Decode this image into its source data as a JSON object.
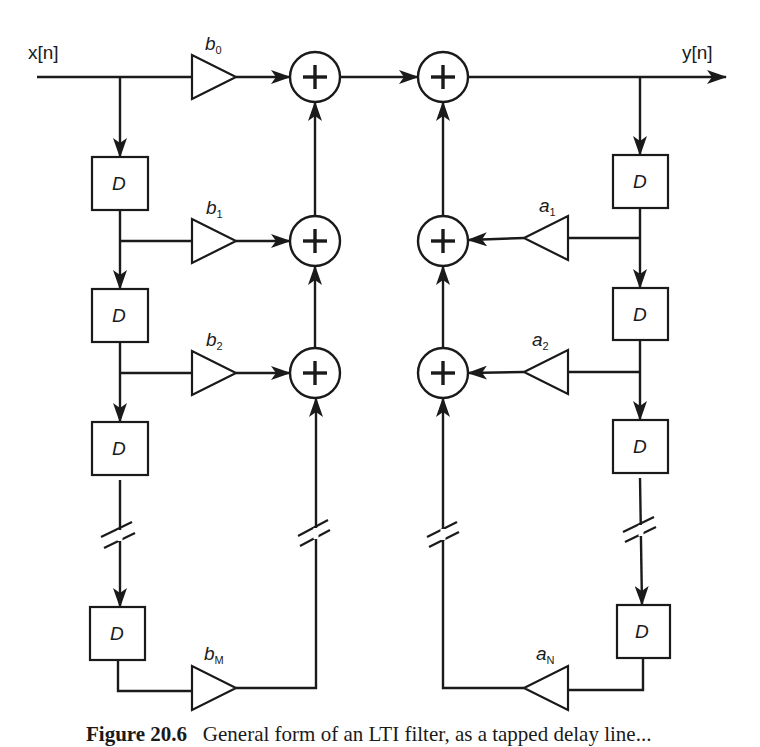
{
  "figure": {
    "type": "block-diagram",
    "input_label": "x[n]",
    "output_label": "y[n]",
    "delay_label": "D",
    "feedforward_coefficients": [
      {
        "symbol": "b",
        "subscript": "0"
      },
      {
        "symbol": "b",
        "subscript": "1"
      },
      {
        "symbol": "b",
        "subscript": "2"
      },
      {
        "symbol": "b",
        "subscript": "M"
      }
    ],
    "feedback_coefficients": [
      {
        "symbol": "a",
        "subscript": "1"
      },
      {
        "symbol": "a",
        "subscript": "2"
      },
      {
        "symbol": "a",
        "subscript": "N"
      }
    ],
    "adder_symbol": "+",
    "left_delay_count_visible": 4,
    "right_delay_count_visible": 4,
    "adders_visible": 6
  },
  "caption": {
    "label": "Figure 20.6",
    "text": "General form of an LTI filter, as a tapped delay line..."
  }
}
